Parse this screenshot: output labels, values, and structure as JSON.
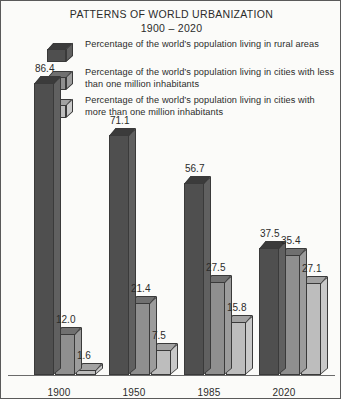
{
  "chart_title": "PATTERNS OF WORLD URBANIZATION",
  "chart_subtitle": "1900 – 2020",
  "colors": {
    "series_rural": "#4f4f4f",
    "series_rural_top": "#3b3b3b",
    "series_rural_side": "#606060",
    "series_small_cities": "#8f8f8f",
    "series_small_cities_top": "#707070",
    "series_small_cities_side": "#9c9c9c",
    "series_large_cities": "#bdbdbd",
    "series_large_cities_top": "#a2a2a2",
    "series_large_cities_side": "#c9c9c9",
    "background": "#fbfbf9",
    "frame": "#5a5a5a",
    "text": "#2b2b2b",
    "axis": "#6a6a6a"
  },
  "legend": {
    "items": [
      {
        "swatch_name": "legend-swatch-rural",
        "label": "Percentage of the world’s population living in rural areas"
      },
      {
        "swatch_name": "legend-swatch-small-cities",
        "label": "Percentage of the world’s population living in cities with less than one million inhabitants"
      },
      {
        "swatch_name": "legend-swatch-large-cities",
        "label": "Percentage of the world’s population living in cities with more than one million inhabitants"
      }
    ]
  },
  "chart_data": {
    "type": "bar",
    "title": "PATTERNS OF WORLD URBANIZATION",
    "subtitle": "1900 – 2020",
    "xlabel": "",
    "ylabel": "",
    "ylim": [
      0,
      100
    ],
    "grid": false,
    "legend_position": "top",
    "value_labels": true,
    "categories": [
      "1900",
      "1950",
      "1985",
      "2020"
    ],
    "series": [
      {
        "name": "Percentage of the world’s population living in rural areas",
        "values": [
          86.4,
          71.1,
          56.7,
          37.5
        ]
      },
      {
        "name": "Percentage of the world’s population living in cities with less than one million inhabitants",
        "values": [
          12.0,
          21.4,
          27.5,
          35.4
        ]
      },
      {
        "name": "Percentage of the world’s population living in cities with more than one million inhabitants",
        "values": [
          1.6,
          7.5,
          15.8,
          27.1
        ]
      }
    ],
    "value_label_text": [
      [
        "86.4",
        "12.0",
        "1.6"
      ],
      [
        "71.1",
        "21.4",
        "7.5"
      ],
      [
        "56.7",
        "27.5",
        "15.8"
      ],
      [
        "37.5",
        "35.4",
        "27.1"
      ]
    ]
  }
}
